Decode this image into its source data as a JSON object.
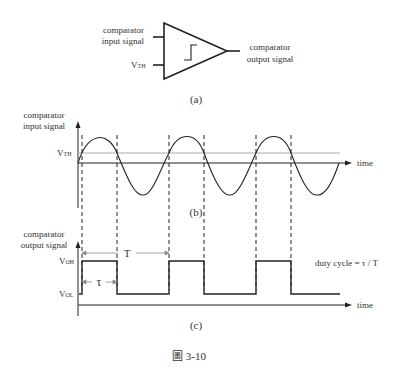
{
  "panel_a": {
    "input_label_1": "comparator",
    "input_label_2": "input signal",
    "vth_label": "V",
    "vth_sub": "TH",
    "output_label_1": "comparator",
    "output_label_2": "output signal",
    "caption": "(a)"
  },
  "panel_b": {
    "ylabel_1": "comparator",
    "ylabel_2": "input signal",
    "vth_label": "V",
    "vth_sub": "TH",
    "xlabel": "time",
    "caption": "(b)"
  },
  "panel_c": {
    "ylabel_1": "comparator",
    "ylabel_2": "output signal",
    "voh_label": "V",
    "voh_sub": "OH",
    "vol_label": "V",
    "vol_sub": "OL",
    "period_label": "T",
    "tau_label": "τ",
    "duty_label": "duty cycle = τ / T",
    "xlabel": "time",
    "caption": "(c)"
  },
  "figure_caption": "圖 3-10",
  "colors": {
    "stroke": "#222222",
    "threshold_line": "#aaaaaa"
  }
}
